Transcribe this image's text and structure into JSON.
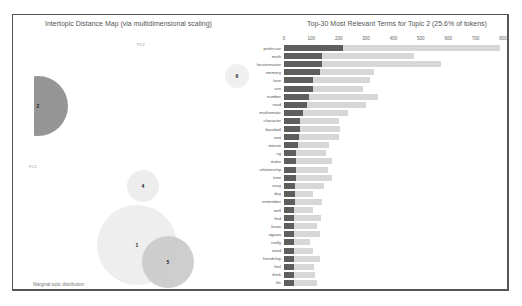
{
  "left_panel": {
    "title": "Intertopic Distance Map (via multidimensional scaling)",
    "pc1_label": "PC1",
    "pc2_label": "PC2",
    "footer_label": "Marginal topic distribution",
    "topics": [
      {
        "id": "1",
        "cx": 137,
        "cy": 245,
        "r": 40,
        "color": "#ececec"
      },
      {
        "id": "2",
        "cx": 38,
        "cy": 106,
        "r": 30,
        "color": "#8a8a8a"
      },
      {
        "id": "4",
        "cx": 143,
        "cy": 186,
        "r": 16,
        "color": "#ebebeb"
      },
      {
        "id": "5",
        "cx": 168,
        "cy": 262,
        "r": 26,
        "color": "#c9c9c9"
      },
      {
        "id": "6",
        "cx": 237,
        "cy": 76,
        "r": 12,
        "color": "#eeeeee"
      }
    ]
  },
  "chart_data": {
    "type": "bar",
    "orientation": "horizontal",
    "title": "Top-30 Most Relevant Terms for Topic 2 (25.6% of tokens)",
    "xlim": [
      0,
      800
    ],
    "xticks": [
      "0",
      "100",
      "200",
      "300",
      "400",
      "500",
      "600",
      "700",
      "800"
    ],
    "categories": [
      "professor",
      "math",
      "housemaster",
      "memory",
      "love",
      "son",
      "number",
      "read",
      "mathematic",
      "character",
      "baseball",
      "root",
      "minute",
      "rig",
      "make",
      "relationship",
      "time",
      "easy",
      "day",
      "remember",
      "well",
      "find",
      "know",
      "ogawa",
      "really",
      "word",
      "friendship",
      "feel",
      "think",
      "life"
    ],
    "series": [
      {
        "name": "Overall term frequency",
        "color": "#d7d7d7",
        "values": [
          790,
          475,
          575,
          330,
          315,
          290,
          345,
          300,
          235,
          200,
          205,
          200,
          165,
          155,
          175,
          160,
          175,
          145,
          105,
          140,
          105,
          135,
          120,
          130,
          95,
          105,
          130,
          110,
          115,
          120
        ]
      },
      {
        "name": "Estimated term frequency within the selected topic",
        "color": "#5e5e5e",
        "values": [
          215,
          140,
          140,
          130,
          105,
          105,
          90,
          85,
          70,
          60,
          60,
          55,
          50,
          45,
          45,
          45,
          45,
          40,
          40,
          40,
          38,
          38,
          38,
          38,
          36,
          36,
          36,
          35,
          35,
          35
        ]
      }
    ],
    "xlabel": "",
    "ylabel": ""
  }
}
